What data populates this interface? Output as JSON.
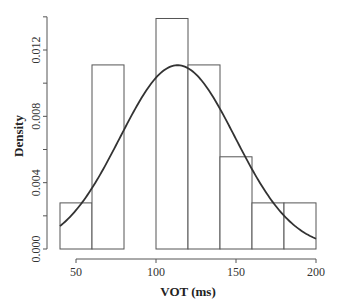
{
  "chart_data": {
    "type": "bar",
    "subtype": "histogram_with_density",
    "title": "",
    "xlabel": "VOT (ms)",
    "ylabel": "Density",
    "xlim": [
      40,
      200
    ],
    "ylim": [
      0,
      0.014
    ],
    "x_ticks": [
      50,
      100,
      150,
      200
    ],
    "x_tick_labels": [
      "50",
      "100",
      "150",
      "200"
    ],
    "y_ticks": [
      0.0,
      0.004,
      0.008,
      0.012
    ],
    "y_tick_labels": [
      "0.000",
      "0.004",
      "0.008",
      "0.012"
    ],
    "grid": false,
    "legend": null,
    "bins": [
      {
        "start": 40,
        "end": 60,
        "density": 0.00278
      },
      {
        "start": 60,
        "end": 80,
        "density": 0.0111
      },
      {
        "start": 80,
        "end": 100,
        "density": 0.0
      },
      {
        "start": 100,
        "end": 120,
        "density": 0.0139
      },
      {
        "start": 120,
        "end": 140,
        "density": 0.0111
      },
      {
        "start": 140,
        "end": 160,
        "density": 0.00556
      },
      {
        "start": 160,
        "end": 180,
        "density": 0.00278
      },
      {
        "start": 180,
        "end": 200,
        "density": 0.00278
      }
    ],
    "categories": [
      "40-60",
      "60-80",
      "80-100",
      "100-120",
      "120-140",
      "140-160",
      "160-180",
      "180-200"
    ],
    "values": [
      0.00278,
      0.0111,
      0.0,
      0.0139,
      0.0111,
      0.00556,
      0.00278,
      0.00278
    ],
    "series": [
      {
        "name": "normal density curve",
        "type": "line",
        "mean": 113.5,
        "sd": 36,
        "x": [
          40,
          60,
          80,
          100,
          113.5,
          120,
          140,
          160,
          180,
          200
        ],
        "y": [
          0.00137,
          0.00366,
          0.0073,
          0.01034,
          0.01108,
          0.0109,
          0.00843,
          0.00482,
          0.00201,
          0.00062
        ]
      }
    ]
  }
}
